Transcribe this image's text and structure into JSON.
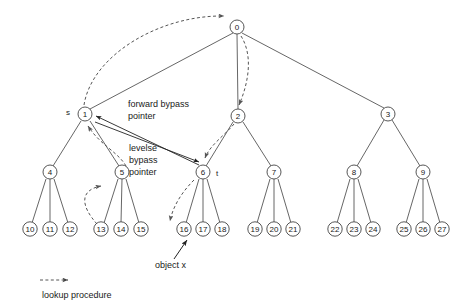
{
  "figure": {
    "title": "",
    "type": "tree-diagram",
    "width": 471,
    "height": 308,
    "colors": {
      "background": "#ffffff",
      "node_stroke": "#444444",
      "node_fill": "#ffffff",
      "edge": "#555555",
      "bypass_arrow": "#222222",
      "lookup_dashed": "#555555",
      "text": "#1a1a1a"
    }
  },
  "nodes": [
    {
      "id": "0",
      "label": "0",
      "x": 237,
      "y": 27,
      "level": 0
    },
    {
      "id": "1",
      "label": "1",
      "x": 85,
      "y": 114,
      "level": 1
    },
    {
      "id": "2",
      "label": "2",
      "x": 238,
      "y": 116,
      "level": 1
    },
    {
      "id": "3",
      "label": "3",
      "x": 388,
      "y": 114,
      "level": 1
    },
    {
      "id": "4",
      "label": "4",
      "x": 50,
      "y": 172,
      "level": 2
    },
    {
      "id": "5",
      "label": "5",
      "x": 122,
      "y": 172,
      "level": 2
    },
    {
      "id": "6",
      "label": "6",
      "x": 203,
      "y": 172,
      "level": 2
    },
    {
      "id": "7",
      "label": "7",
      "x": 274,
      "y": 172,
      "level": 2
    },
    {
      "id": "8",
      "label": "8",
      "x": 354,
      "y": 172,
      "level": 2
    },
    {
      "id": "9",
      "label": "9",
      "x": 423,
      "y": 172,
      "level": 2
    },
    {
      "id": "10",
      "label": "10",
      "x": 30,
      "y": 229,
      "level": 3
    },
    {
      "id": "11",
      "label": "11",
      "x": 50,
      "y": 229,
      "level": 3
    },
    {
      "id": "12",
      "label": "12",
      "x": 70,
      "y": 229,
      "level": 3
    },
    {
      "id": "13",
      "label": "13",
      "x": 101,
      "y": 229,
      "level": 3
    },
    {
      "id": "14",
      "label": "14",
      "x": 121,
      "y": 229,
      "level": 3
    },
    {
      "id": "15",
      "label": "15",
      "x": 141,
      "y": 229,
      "level": 3
    },
    {
      "id": "16",
      "label": "16",
      "x": 184,
      "y": 229,
      "level": 3
    },
    {
      "id": "17",
      "label": "17",
      "x": 203,
      "y": 229,
      "level": 3
    },
    {
      "id": "18",
      "label": "18",
      "x": 222,
      "y": 229,
      "level": 3
    },
    {
      "id": "19",
      "label": "19",
      "x": 255,
      "y": 229,
      "level": 3
    },
    {
      "id": "20",
      "label": "20",
      "x": 274,
      "y": 229,
      "level": 3
    },
    {
      "id": "21",
      "label": "21",
      "x": 293,
      "y": 229,
      "level": 3
    },
    {
      "id": "22",
      "label": "22",
      "x": 335,
      "y": 229,
      "level": 3
    },
    {
      "id": "23",
      "label": "23",
      "x": 354,
      "y": 229,
      "level": 3
    },
    {
      "id": "24",
      "label": "24",
      "x": 373,
      "y": 229,
      "level": 3
    },
    {
      "id": "25",
      "label": "25",
      "x": 404,
      "y": 229,
      "level": 3
    },
    {
      "id": "26",
      "label": "26",
      "x": 423,
      "y": 229,
      "level": 3
    },
    {
      "id": "27",
      "label": "27",
      "x": 442,
      "y": 229,
      "level": 3
    }
  ],
  "edges": [
    {
      "from": "0",
      "to": "1"
    },
    {
      "from": "0",
      "to": "2"
    },
    {
      "from": "0",
      "to": "3"
    },
    {
      "from": "1",
      "to": "4"
    },
    {
      "from": "1",
      "to": "5"
    },
    {
      "from": "2",
      "to": "6"
    },
    {
      "from": "2",
      "to": "7"
    },
    {
      "from": "3",
      "to": "8"
    },
    {
      "from": "3",
      "to": "9"
    },
    {
      "from": "4",
      "to": "10"
    },
    {
      "from": "4",
      "to": "11"
    },
    {
      "from": "4",
      "to": "12"
    },
    {
      "from": "5",
      "to": "13"
    },
    {
      "from": "5",
      "to": "14"
    },
    {
      "from": "5",
      "to": "15"
    },
    {
      "from": "6",
      "to": "16"
    },
    {
      "from": "6",
      "to": "17"
    },
    {
      "from": "6",
      "to": "18"
    },
    {
      "from": "7",
      "to": "19"
    },
    {
      "from": "7",
      "to": "20"
    },
    {
      "from": "7",
      "to": "21"
    },
    {
      "from": "8",
      "to": "22"
    },
    {
      "from": "8",
      "to": "23"
    },
    {
      "from": "8",
      "to": "24"
    },
    {
      "from": "9",
      "to": "25"
    },
    {
      "from": "9",
      "to": "26"
    },
    {
      "from": "9",
      "to": "27"
    }
  ],
  "node_markers": [
    {
      "name": "marker-s",
      "text": "s",
      "x": 68,
      "y": 112
    },
    {
      "name": "marker-t",
      "text": "t",
      "x": 217,
      "y": 173
    }
  ],
  "annotations": [
    {
      "name": "forward-bypass-pointer-label",
      "lines": [
        "forward bypass",
        "pointer"
      ],
      "x": 128,
      "y": 104
    },
    {
      "name": "levelse-bypass-pointer-label",
      "lines": [
        "levelse",
        "bypass",
        "pointer"
      ],
      "x": 129,
      "y": 148
    },
    {
      "name": "object-x-label",
      "lines": [
        "object x"
      ],
      "x": 155,
      "y": 265
    }
  ],
  "legend": {
    "name": "lookup-procedure-legend",
    "label": "lookup procedure",
    "label_x": 42,
    "label_y": 295,
    "arrow_x1": 40,
    "arrow_x2": 73,
    "arrow_y": 280,
    "style": "dashed-arrow"
  },
  "bypass_arrows": [
    {
      "name": "bypass-arrow-1-to-6",
      "from": "1",
      "to": "6",
      "double_headed": true,
      "description": "forward bypass pointer between node 1 and node 6"
    }
  ],
  "lookup_paths": [
    {
      "name": "lookup-1-to-0",
      "from": "1",
      "to": "0"
    },
    {
      "name": "lookup-0-to-2",
      "from": "0",
      "to": "2"
    },
    {
      "name": "lookup-2-to-6",
      "from": "2",
      "to": "6"
    },
    {
      "name": "lookup-6-to-16",
      "from": "6",
      "to": "16"
    },
    {
      "name": "lookup-13-to-5",
      "from": "13",
      "to": "5"
    },
    {
      "name": "lookup-5-to-1",
      "from": "5",
      "to": "1"
    }
  ],
  "object_pointer": {
    "name": "object-x-pointer",
    "target": "16",
    "from_x": 177,
    "from_y": 258,
    "to_x": 186,
    "to_y": 240
  }
}
